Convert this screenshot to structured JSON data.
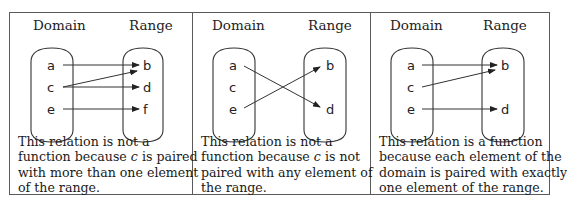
{
  "panels": [
    {
      "domain_header": "Domain",
      "range_header": "Range",
      "domain_elements": [
        "a",
        "c",
        "e"
      ],
      "range_elements": [
        "b",
        "d",
        "f"
      ],
      "mappings": [
        [
          "a",
          "b"
        ],
        [
          "c",
          "b"
        ],
        [
          "c",
          "d"
        ],
        [
          "e",
          "f"
        ]
      ],
      "caption_lines": [
        "This relation is not a",
        "function because |c| is paired",
        "with more than one element",
        "of the range."
      ],
      "caption": {
        "l1": "This relation is not a",
        "l2_pre": "function because ",
        "l2_var": "c",
        "l2_post": " is paired",
        "l3": "with more than one element",
        "l4": "of the range."
      }
    },
    {
      "domain_header": "Domain",
      "range_header": "Range",
      "domain_elements": [
        "a",
        "c",
        "e"
      ],
      "range_elements": [
        "b",
        "d"
      ],
      "mappings": [
        [
          "a",
          "d"
        ],
        [
          "e",
          "b"
        ]
      ],
      "caption": {
        "l1": "This relation is not a",
        "l2_pre": "function because ",
        "l2_var": "c",
        "l2_post": " is not",
        "l3": "paired with any element of",
        "l4": "the range."
      }
    },
    {
      "domain_header": "Domain",
      "range_header": "Range",
      "domain_elements": [
        "a",
        "c",
        "e"
      ],
      "range_elements": [
        "b",
        "d"
      ],
      "mappings": [
        [
          "a",
          "b"
        ],
        [
          "c",
          "b"
        ],
        [
          "e",
          "d"
        ]
      ],
      "caption": {
        "l1": "This relation is a function",
        "l2": "because each element of the",
        "l3": "domain is paired with exactly",
        "l4": "one element of the range."
      }
    }
  ]
}
